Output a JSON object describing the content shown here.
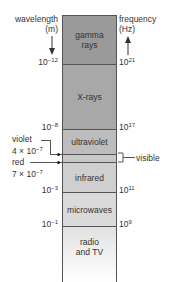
{
  "left_axis": {
    "title_line1": "wavelength",
    "title_line2": "(m)",
    "arrow": "down-arrow-icon",
    "ticks": [
      {
        "base": "10",
        "exp": "−12"
      },
      {
        "base": "10",
        "exp": "−8"
      },
      {
        "base": "10",
        "exp": "−3"
      },
      {
        "base": "10",
        "exp": "−1"
      }
    ]
  },
  "right_axis": {
    "title_line1": "frequency",
    "title_line2": "(Hz)",
    "arrow": "up-arrow-icon",
    "ticks": [
      {
        "base": "10",
        "exp": "21"
      },
      {
        "base": "10",
        "exp": "17"
      },
      {
        "base": "10",
        "exp": "11"
      },
      {
        "base": "10",
        "exp": "9"
      }
    ]
  },
  "bands": [
    {
      "line1": "gamma",
      "line2": "rays",
      "color": "#9a9a9a"
    },
    {
      "line1": "X-rays",
      "line2": "",
      "color": "#a8a8a8"
    },
    {
      "line1": "ultraviolet",
      "line2": "",
      "color": "#bdbdbd"
    },
    {
      "line1": "",
      "line2": "",
      "color": "#c8c8c8"
    },
    {
      "line1": "infrared",
      "line2": "",
      "color": "#cfcfcf"
    },
    {
      "line1": "microwaves",
      "line2": "",
      "color": "#dadada"
    },
    {
      "line1": "radio",
      "line2": "and TV",
      "color": "#eaeaea"
    }
  ],
  "visible_label": "visible",
  "violet": {
    "name": "violet",
    "base": "4 × 10",
    "exp": "−7"
  },
  "red": {
    "name": "red",
    "base": "7 × 10",
    "exp": "−7"
  }
}
